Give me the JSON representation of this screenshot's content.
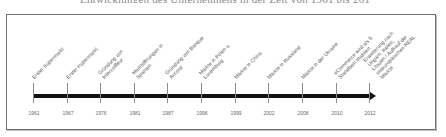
{
  "caption": "Entwicklungen des Unternehmens in der Zeit von 1961 bis 2012 (Unternehmensgeschichte)",
  "timeline": {
    "arrow_color": "#111111",
    "frame_color": "#6e6e6e",
    "events": [
      {
        "year": "1961",
        "label": "Erster Supermarkt",
        "x": 33
      },
      {
        "year": "1967",
        "label": "Erster Hypermarkt",
        "x": 67
      },
      {
        "year": "1976",
        "label": "Gründung von\nIntercoiffeur",
        "x": 100
      },
      {
        "year": "1981",
        "label": "Marktöffnungen in\nSpanien",
        "x": 134
      },
      {
        "year": "1987",
        "label": "Gründung von Banque\nAccord",
        "x": 167
      },
      {
        "year": "1996",
        "label": "Märkte in Polen u.\nLuxemburg",
        "x": 201
      },
      {
        "year": "1999",
        "label": "Märkte in China",
        "x": 235
      },
      {
        "year": "2002",
        "label": "Märkte in Russland",
        "x": 268
      },
      {
        "year": "2008",
        "label": "Märkte in der Ukraine",
        "x": 302
      },
      {
        "year": "2010",
        "label": "eCommerce wird als 5.\nStandbein etabliert",
        "x": 336
      },
      {
        "year": "2012",
        "label": "Erweiterung nach\nUngarn, Italien,\nLitauen / Aufkauf der\nosteuropäischen REAL\nMärkte",
        "x": 369
      }
    ]
  }
}
